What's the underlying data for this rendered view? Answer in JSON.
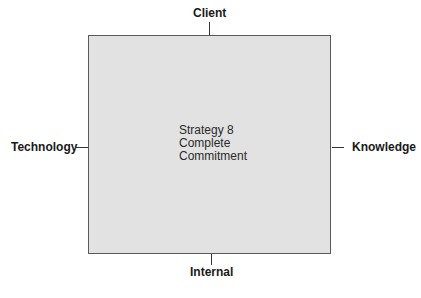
{
  "diagram": {
    "center": {
      "lines": [
        "Strategy 8",
        "Complete",
        "Commitment"
      ]
    },
    "axes": {
      "top": "Client",
      "bottom": "Internal",
      "left": "Technology",
      "right": "Knowledge"
    },
    "colors": {
      "box_fill": "#e2e2e2",
      "box_border": "#5a5a5a"
    }
  }
}
